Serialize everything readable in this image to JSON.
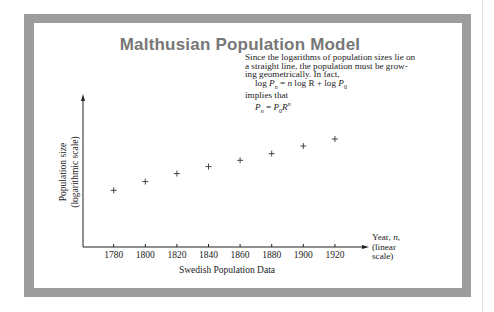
{
  "figure": {
    "title": "Malthusian Population Model",
    "note_lines": [
      "Since the logarithms of population sizes lie on",
      "a straight line, the population must be grow-",
      "ing geometrically.  In fact,"
    ],
    "equation_1": "log P_n = n log R + log P_0",
    "implies": "implies that",
    "equation_2": "P_n = P_0 R^n",
    "frame_color": "#9c9c9c",
    "title_color": "#777777"
  },
  "chart_data": {
    "type": "scatter",
    "title": "Malthusian Population Model",
    "subtitle": "Swedish Population Data",
    "xlabel": "Year, n, (linear scale)",
    "ylabel": "Population size (logarithmic scale)",
    "x": [
      1780,
      1800,
      1820,
      1840,
      1860,
      1880,
      1900,
      1920
    ],
    "y_relative_height": [
      56.7,
      65.4,
      73.4,
      80.4,
      86.7,
      93.4,
      101.0,
      108.0
    ],
    "y_note": "y values are unlabeled on the chart; given as relative plotted heights above the x-axis (px)",
    "xticks": [
      "1780",
      "1800",
      "1820",
      "1840",
      "1860",
      "1880",
      "1900",
      "1920"
    ],
    "yticks": [],
    "marker": "+",
    "grid": false,
    "legend": null
  }
}
